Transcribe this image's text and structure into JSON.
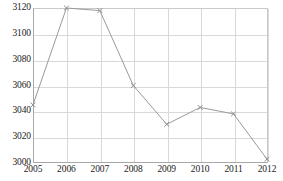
{
  "chart_data": {
    "type": "line",
    "title": "",
    "subtitle": "",
    "xlabel": "",
    "ylabel": "",
    "categories": [
      "2005",
      "2006",
      "2007",
      "2008",
      "2009",
      "2010",
      "2011",
      "2012"
    ],
    "values": [
      3045,
      3120,
      3118,
      3060,
      3030,
      3043,
      3038,
      3003
    ],
    "series": [
      {
        "name": "",
        "values": [
          3045,
          3120,
          3118,
          3060,
          3030,
          3043,
          3038,
          3003
        ]
      }
    ],
    "ylim": [
      3000,
      3120
    ],
    "xlim": [
      "2005",
      "2012"
    ],
    "yticks": [
      3000,
      3020,
      3040,
      3060,
      3080,
      3100,
      3120
    ],
    "xticks": [
      "2005",
      "2006",
      "2007",
      "2008",
      "2009",
      "2010",
      "2011",
      "2012"
    ],
    "grid": true,
    "legend": false,
    "legend_position": "none",
    "annotations": [],
    "colors": {
      "line": "#9a9a9a",
      "marker": "#8f8f8f",
      "grid": "#d9d9d9",
      "axis": "#a8a8a8",
      "text": "#1a1a1a",
      "background": "#ffffff"
    },
    "marker_style": "x"
  }
}
